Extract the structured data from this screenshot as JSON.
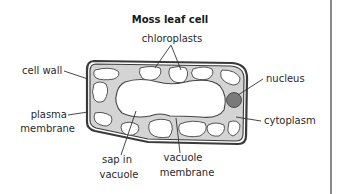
{
  "title": "Moss leaf cell",
  "labels": {
    "chloroplasts": "chloroplasts",
    "cell_wall": "cell wall",
    "nucleus": "nucleus",
    "plasma_line1": "plasma",
    "plasma_line2": "membrane",
    "cytoplasm": "cytoplasm",
    "sap_line1": "sap in",
    "sap_line2": "vacuole",
    "vac_line1": "vacuole",
    "vac_line2": "membrane"
  },
  "colors": {
    "cytoplasm": "#d4d4d4",
    "outline": "#3a3a3a",
    "nucleus": "#7a7a7a",
    "vacuole": "#ffffff"
  }
}
